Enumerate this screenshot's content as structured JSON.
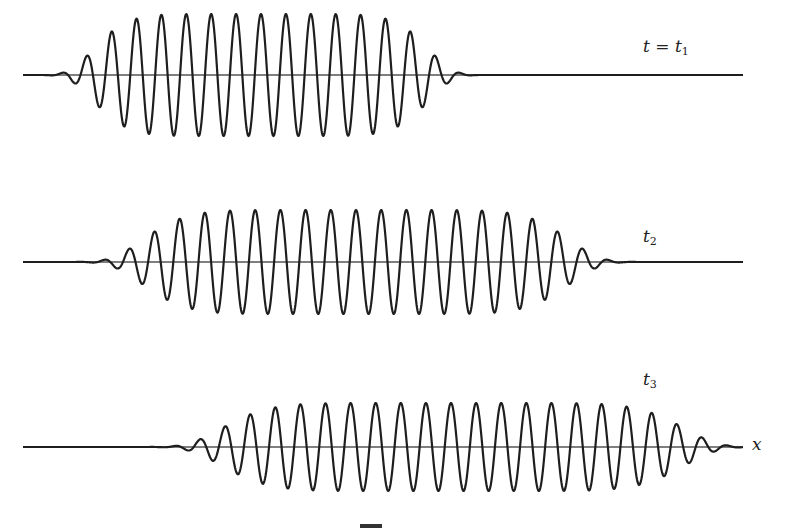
{
  "figure": {
    "axis_label": "x",
    "background": "#ffffff",
    "stroke_color": "#1e1e1e",
    "axis_color": "#555555"
  },
  "chart_data": {
    "type": "line",
    "title": "",
    "xlabel": "x",
    "ylabel": "",
    "grid": false,
    "series": [
      {
        "name": "t = t1",
        "label_main": "t = t",
        "label_sub": "1",
        "axis_y": 75,
        "x_start": 23,
        "x_end": 743,
        "envelope_center": 261,
        "envelope_halfwidth": 171,
        "envelope_power": 8,
        "amplitude": 61,
        "wavelength": 24.9,
        "phase_peak_x": 261,
        "label_x": 643,
        "label_y": 38
      },
      {
        "name": "t2",
        "label_main": "t",
        "label_sub": "2",
        "axis_y": 262,
        "x_start": 23,
        "x_end": 743,
        "envelope_center": 356,
        "envelope_halfwidth": 218,
        "envelope_power": 8,
        "amplitude": 52,
        "wavelength": 25.2,
        "phase_peak_x": 356,
        "label_x": 643,
        "label_y": 228
      },
      {
        "name": "t3",
        "label_main": "t",
        "label_sub": "3",
        "axis_y": 447,
        "x_start": 23,
        "x_end": 743,
        "envelope_center": 453,
        "envelope_halfwidth": 236,
        "envelope_power": 8,
        "amplitude": 44,
        "wavelength": 25.1,
        "phase_peak_x": 451,
        "label_x": 643,
        "label_y": 371
      }
    ],
    "annotations": [
      "t = t1",
      "t2",
      "t3",
      "x"
    ]
  },
  "labels": {
    "t1_main": "t = t",
    "t1_sub": "1",
    "t2_main": "t",
    "t2_sub": "2",
    "t3_main": "t",
    "t3_sub": "3",
    "x_axis": "x"
  }
}
